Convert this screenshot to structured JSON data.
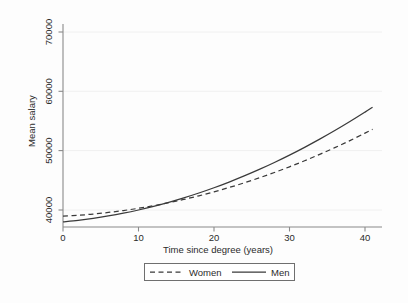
{
  "chart_data": {
    "type": "line",
    "title": "",
    "xlabel": "Time since degree (years)",
    "ylabel": "Mean salary",
    "xlim": [
      -1,
      42
    ],
    "ylim": [
      36500,
      72000
    ],
    "xticks": [
      0,
      10,
      20,
      30,
      40
    ],
    "xtick_labels": [
      "0",
      "10",
      "20",
      "30",
      "40"
    ],
    "yticks": [
      40000,
      50000,
      60000,
      70000
    ],
    "ytick_labels": [
      "40000",
      "50000",
      "60000",
      "70000"
    ],
    "grid": "horizontal",
    "legend_position": "bottom",
    "x": [
      0,
      2,
      4,
      6,
      8,
      10,
      12,
      14,
      16,
      18,
      20,
      22,
      24,
      26,
      28,
      30,
      32,
      34,
      36,
      38,
      40,
      41
    ],
    "series": [
      {
        "name": "Women",
        "style": "dashed",
        "color": "#3a3a3a",
        "values": [
          38950,
          39110,
          39320,
          39590,
          39910,
          40290,
          40730,
          41230,
          41780,
          42390,
          43060,
          43790,
          44570,
          45420,
          46320,
          47280,
          48300,
          49380,
          50510,
          51700,
          52950,
          53600
        ]
      },
      {
        "name": "Men",
        "style": "solid",
        "color": "#3a3a3a",
        "values": [
          38000,
          38260,
          38590,
          38990,
          39460,
          40000,
          40610,
          41290,
          42040,
          42860,
          43750,
          44710,
          45740,
          46840,
          48010,
          49250,
          50560,
          51940,
          53390,
          54910,
          56500,
          57320
        ]
      }
    ],
    "legend": [
      {
        "label": "Women",
        "style": "dashed"
      },
      {
        "label": "Men",
        "style": "solid"
      }
    ]
  }
}
